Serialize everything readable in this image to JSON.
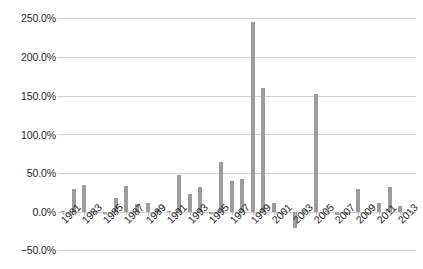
{
  "chart_data": {
    "type": "bar",
    "title": "",
    "subtitle": "",
    "xlabel": "",
    "ylabel": "",
    "legend": [],
    "grid": true,
    "legend_position": "none",
    "ylim": [
      -50,
      250
    ],
    "ytick_labels": [
      "250.0%",
      "200.0%",
      "150.0%",
      "100.0%",
      "50.0%",
      "0.0%",
      "−50.0%"
    ],
    "ytick_values": [
      250,
      200,
      150,
      100,
      50,
      0,
      -50
    ],
    "xtick_labels": [
      "1981",
      "1983",
      "1985",
      "1987",
      "1989",
      "1991",
      "1993",
      "1995",
      "1997",
      "1999",
      "2001",
      "2003",
      "2005",
      "2007",
      "2009",
      "2011",
      "2013"
    ],
    "categories": [
      "1981",
      "1982",
      "1983",
      "1984",
      "1985",
      "1986",
      "1987",
      "1988",
      "1989",
      "1990",
      "1991",
      "1992",
      "1993",
      "1994",
      "1995",
      "1996",
      "1997",
      "1998",
      "1999",
      "2000",
      "2001",
      "2002",
      "2003",
      "2004",
      "2005",
      "2006",
      "2007",
      "2008",
      "2009",
      "2010",
      "2011",
      "2012",
      "2013",
      "2014"
    ],
    "values": [
      1.5,
      30.0,
      35.0,
      1.0,
      -2.0,
      17.5,
      33.0,
      10.0,
      12.0,
      3.5,
      1.0,
      48.0,
      23.0,
      32.0,
      -3.0,
      64.0,
      40.0,
      43.0,
      245.0,
      160.0,
      12.0,
      1.0,
      -20.0,
      3.0,
      152.0,
      1.5,
      -3.5,
      -4.0,
      30.0,
      -3.0,
      12.0,
      32.0,
      8.0,
      1.0
    ],
    "series_color": "#9c9c9c",
    "gridline_color": "#d2d2d2",
    "background_color": "#ffffff"
  }
}
